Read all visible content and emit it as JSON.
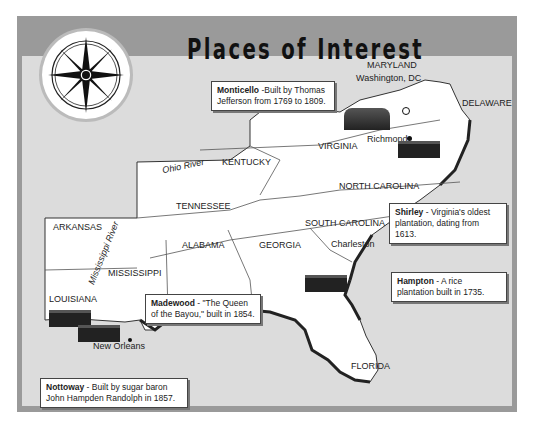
{
  "title": "Places of Interest",
  "compass": {
    "icon": "compass-rose-icon"
  },
  "states": [
    {
      "name": "MARYLAND"
    },
    {
      "name": "DELAWARE"
    },
    {
      "name": "VIRGINIA"
    },
    {
      "name": "KENTUCKY"
    },
    {
      "name": "NORTH CAROLINA"
    },
    {
      "name": "TENNESSEE"
    },
    {
      "name": "SOUTH CAROLINA"
    },
    {
      "name": "ARKANSAS"
    },
    {
      "name": "ALABAMA"
    },
    {
      "name": "GEORGIA"
    },
    {
      "name": "MISSISSIPPI"
    },
    {
      "name": "LOUISIANA"
    },
    {
      "name": "FLORIDA"
    }
  ],
  "cities": [
    {
      "name": "Washington, DC"
    },
    {
      "name": "Richmond"
    },
    {
      "name": "Charleston"
    },
    {
      "name": "New Orleans"
    }
  ],
  "rivers": [
    {
      "name": "Ohio River"
    },
    {
      "name": "Mississippi River"
    }
  ],
  "callouts": [
    {
      "name": "Monticello",
      "text": " -Built by Thomas Jefferson from 1769 to 1809."
    },
    {
      "name": "Shirley",
      "text": " - Virginia's oldest plantation, dating from 1613."
    },
    {
      "name": "Hampton",
      "text": " - A rice plantation built in 1735."
    },
    {
      "name": "Madewood",
      "text": " - \"The Queen of the Bayou,\" built in 1854."
    },
    {
      "name": "Nottoway",
      "text": " - Built by sugar baron John Hampden Randolph in 1857."
    }
  ],
  "colors": {
    "frame": "#9a9a9a",
    "sea": "#dcdcdc",
    "land": "#ffffff",
    "coast": "#222222"
  }
}
